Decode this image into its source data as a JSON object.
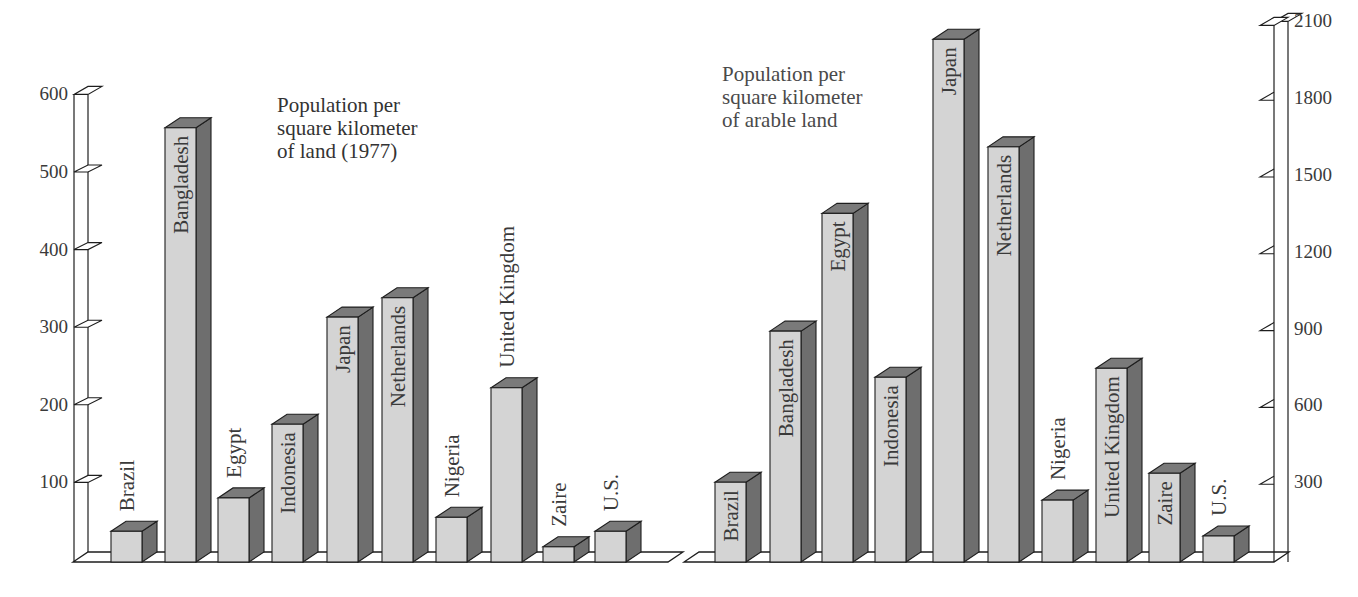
{
  "chart_data": [
    {
      "type": "bar",
      "title": "Population per square kilometer of land (1977)",
      "title_lines": [
        "Population per",
        "square kilometer",
        "of land (1977)"
      ],
      "xlabel": "",
      "ylabel": "",
      "axis_side": "left",
      "ylim": [
        0,
        600
      ],
      "yticks": [
        100,
        200,
        300,
        400,
        500,
        600
      ],
      "grid": false,
      "style": "3d-bar",
      "categories": [
        "Brazil",
        "Bangladesh",
        "Egypt",
        "Indonesia",
        "Japan",
        "Netherlands",
        "Nigeria",
        "United Kingdom",
        "Zaire",
        "U.S."
      ],
      "values": [
        37,
        557,
        80,
        175,
        313,
        338,
        55,
        222,
        17,
        37
      ],
      "label_inside": [
        false,
        true,
        false,
        true,
        true,
        true,
        false,
        false,
        false,
        false
      ]
    },
    {
      "type": "bar",
      "title": "Population per square kilometer of arable land",
      "title_lines": [
        "Population per",
        "square kilometer",
        "of arable land"
      ],
      "xlabel": "",
      "ylabel": "",
      "axis_side": "right",
      "ylim": [
        0,
        2100
      ],
      "yticks": [
        300,
        600,
        900,
        1200,
        1500,
        1800,
        2100
      ],
      "grid": false,
      "style": "3d-bar",
      "categories": [
        "Brazil",
        "Bangladesh",
        "Egypt",
        "Indonesia",
        "Japan",
        "Netherlands",
        "Nigeria",
        "United Kingdom",
        "Zaire",
        "U.S."
      ],
      "values": [
        300,
        890,
        1350,
        710,
        2030,
        1610,
        230,
        745,
        335,
        90
      ],
      "label_inside": [
        true,
        true,
        true,
        true,
        true,
        true,
        false,
        true,
        true,
        false
      ]
    }
  ],
  "colors": {
    "bar_front": "#d4d4d4",
    "bar_side": "#6e6e6e",
    "bar_top": "#7a7a7a",
    "outline": "#1e1e1e",
    "text": "#3a3a3a"
  }
}
